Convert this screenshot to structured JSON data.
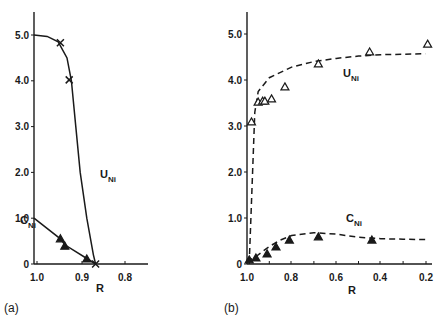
{
  "figure": {
    "panel_a_label": "(a)",
    "panel_b_label": "(b)"
  },
  "chart_data": [
    {
      "type": "line",
      "panel": "(a)",
      "title": "",
      "xlabel": "R",
      "ylabel": "",
      "xlim": [
        1.0,
        0.78
      ],
      "ylim": [
        0,
        5.5
      ],
      "x_ticks": [
        "1.0",
        "0.9",
        "0.8"
      ],
      "y_ticks": [
        "0",
        "1.0",
        "2.0",
        "3.0",
        "4.0",
        "5.0"
      ],
      "grid": false,
      "series": [
        {
          "name": "U_Ni",
          "label_main": "U",
          "label_sub": "Ni",
          "style": "solid line with x markers",
          "points": [
            [
              0.94,
              4.83
            ],
            [
              0.92,
              4.02
            ],
            [
              0.86,
              0.0
            ]
          ],
          "curve": [
            [
              1.0,
              5.0
            ],
            [
              0.97,
              4.97
            ],
            [
              0.945,
              4.85
            ],
            [
              0.925,
              4.5
            ],
            [
              0.915,
              4.0
            ],
            [
              0.905,
              3.0
            ],
            [
              0.895,
              2.0
            ],
            [
              0.88,
              1.0
            ],
            [
              0.865,
              0.2
            ],
            [
              0.86,
              0.0
            ]
          ]
        },
        {
          "name": "C_Ni",
          "label_main": "C",
          "label_sub": "Ni",
          "style": "solid line with filled triangle markers",
          "points": [
            [
              0.94,
              0.55
            ],
            [
              0.93,
              0.39
            ],
            [
              0.88,
              0.11
            ]
          ],
          "curve": [
            [
              1.0,
              1.0
            ],
            [
              0.94,
              0.55
            ],
            [
              0.93,
              0.42
            ],
            [
              0.88,
              0.12
            ],
            [
              0.86,
              0.0
            ]
          ]
        }
      ]
    },
    {
      "type": "line",
      "panel": "(b)",
      "title": "",
      "xlabel": "R",
      "ylabel": "",
      "xlim": [
        1.0,
        0.18
      ],
      "ylim": [
        0,
        5.5
      ],
      "x_ticks": [
        "1.0",
        "0.8",
        "0.6",
        "0.4",
        "0.2"
      ],
      "y_ticks": [
        "0",
        "1.0",
        "2.0",
        "3.0",
        "4.0",
        "5.0"
      ],
      "grid": false,
      "series": [
        {
          "name": "U_Ni",
          "label_main": "U",
          "label_sub": "Ni",
          "style": "dashed line with open triangle markers",
          "points": [
            [
              0.98,
              3.09
            ],
            [
              0.95,
              3.52
            ],
            [
              0.93,
              3.54
            ],
            [
              0.92,
              3.54
            ],
            [
              0.89,
              3.59
            ],
            [
              0.83,
              3.85
            ],
            [
              0.68,
              4.35
            ],
            [
              0.45,
              4.61
            ],
            [
              0.19,
              4.78
            ]
          ],
          "curve": [
            [
              0.99,
              0.0
            ],
            [
              0.975,
              2.0
            ],
            [
              0.965,
              3.3
            ],
            [
              0.95,
              3.75
            ],
            [
              0.9,
              4.05
            ],
            [
              0.8,
              4.28
            ],
            [
              0.7,
              4.4
            ],
            [
              0.6,
              4.47
            ],
            [
              0.5,
              4.52
            ],
            [
              0.4,
              4.55
            ],
            [
              0.3,
              4.56
            ],
            [
              0.2,
              4.57
            ]
          ]
        },
        {
          "name": "C_Ni",
          "label_main": "C",
          "label_sub": "Ni",
          "style": "dashed line with filled triangle markers",
          "points": [
            [
              0.99,
              0.09
            ],
            [
              0.96,
              0.13
            ],
            [
              0.91,
              0.22
            ],
            [
              0.87,
              0.37
            ],
            [
              0.81,
              0.52
            ],
            [
              0.68,
              0.59
            ],
            [
              0.44,
              0.52
            ]
          ],
          "curve": [
            [
              1.0,
              0.05
            ],
            [
              0.95,
              0.2
            ],
            [
              0.9,
              0.38
            ],
            [
              0.85,
              0.52
            ],
            [
              0.8,
              0.62
            ],
            [
              0.7,
              0.68
            ],
            [
              0.6,
              0.65
            ],
            [
              0.5,
              0.58
            ],
            [
              0.4,
              0.55
            ],
            [
              0.3,
              0.54
            ],
            [
              0.2,
              0.53
            ]
          ]
        }
      ]
    }
  ]
}
